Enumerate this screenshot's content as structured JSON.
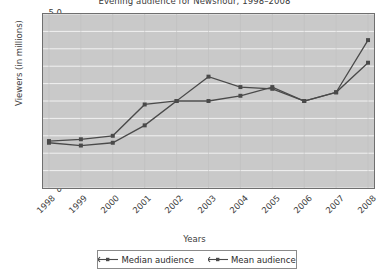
{
  "chart_data": {
    "type": "line",
    "title": "Evening audience for Newshour, 1998–2008",
    "xlabel": "Years",
    "ylabel": "Viewers (in millions)",
    "categories": [
      "1998",
      "1999",
      "2000",
      "2001",
      "2002",
      "2003",
      "2004",
      "2005",
      "2006",
      "2007",
      "2008"
    ],
    "yticks": [
      "0",
      "0.5",
      "1.0",
      "1.5",
      "2.0",
      "2.5",
      "3.0",
      "3.5",
      "4.0",
      "4.5",
      "5.0"
    ],
    "ylim": [
      0,
      5
    ],
    "grid": true,
    "legend_position": "bottom",
    "series": [
      {
        "name": "Median audience",
        "color": "#4a4a4a",
        "values": [
          1.3,
          1.22,
          1.3,
          1.8,
          2.5,
          2.5,
          2.65,
          2.9,
          2.5,
          2.75,
          3.6
        ]
      },
      {
        "name": "Mean audience",
        "color": "#4a4a4a",
        "values": [
          1.35,
          1.4,
          1.5,
          2.4,
          2.5,
          3.2,
          2.9,
          2.85,
          2.5,
          2.75,
          4.25
        ]
      }
    ]
  },
  "legend": {
    "items": [
      {
        "label": "Median audience"
      },
      {
        "label": "Mean audience"
      }
    ]
  },
  "colors": {
    "plot_background": "#c9c9c9",
    "gridline": "#f2f2f2",
    "series_line": "#4a4a4a",
    "axis": "#6f6f6f"
  }
}
